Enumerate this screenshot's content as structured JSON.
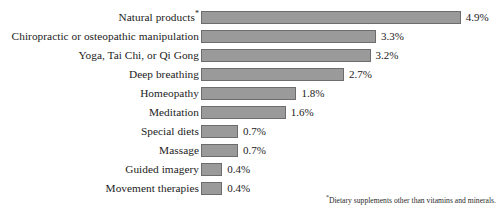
{
  "chart_data": {
    "type": "bar",
    "orientation": "horizontal",
    "title": "",
    "xlabel": "",
    "ylabel": "",
    "xlim": [
      0,
      4.9
    ],
    "grid": false,
    "legend": null,
    "value_suffix": "%",
    "categories": [
      "Natural products*",
      "Chiropractic or osteopathic manipulation",
      "Yoga, Tai Chi, or Qi Gong",
      "Deep breathing",
      "Homeopathy",
      "Meditation",
      "Special diets",
      "Massage",
      "Guided imagery",
      "Movement therapies"
    ],
    "values": [
      4.9,
      3.3,
      3.2,
      2.7,
      1.8,
      1.6,
      0.7,
      0.7,
      0.4,
      0.4
    ],
    "value_labels": [
      "4.9%",
      "3.3%",
      "3.2%",
      "2.7%",
      "1.8%",
      "1.6%",
      "0.7%",
      "0.7%",
      "0.4%",
      "0.4%"
    ],
    "bars": [
      {
        "label": "Natural products",
        "footnote_marker": "*",
        "value": 4.9,
        "value_label": "4.9%"
      },
      {
        "label": "Chiropractic or osteopathic manipulation",
        "footnote_marker": "",
        "value": 3.3,
        "value_label": "3.3%"
      },
      {
        "label": "Yoga, Tai Chi, or Qi Gong",
        "footnote_marker": "",
        "value": 3.2,
        "value_label": "3.2%"
      },
      {
        "label": "Deep breathing",
        "footnote_marker": "",
        "value": 2.7,
        "value_label": "2.7%"
      },
      {
        "label": "Homeopathy",
        "footnote_marker": "",
        "value": 1.8,
        "value_label": "1.8%"
      },
      {
        "label": "Meditation",
        "footnote_marker": "",
        "value": 1.6,
        "value_label": "1.6%"
      },
      {
        "label": "Special diets",
        "footnote_marker": "",
        "value": 0.7,
        "value_label": "0.7%"
      },
      {
        "label": "Massage",
        "footnote_marker": "",
        "value": 0.7,
        "value_label": "0.7%"
      },
      {
        "label": "Guided imagery",
        "footnote_marker": "",
        "value": 0.4,
        "value_label": "0.4%"
      },
      {
        "label": "Movement therapies",
        "footnote_marker": "",
        "value": 0.4,
        "value_label": "0.4%"
      }
    ],
    "colors": {
      "bar_fill": "#9a9a9a",
      "bar_border": "#6d6d6d",
      "text": "#1b1b1b",
      "background": "#ffffff"
    }
  },
  "footnote": {
    "marker": "*",
    "text": "Dietary supplements other than vitamins and minerals."
  },
  "scale": {
    "px_per_unit": 53,
    "bar_origin_x": 203
  }
}
